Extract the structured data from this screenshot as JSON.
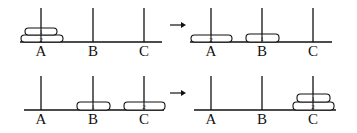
{
  "diagram": {
    "title": "",
    "peg_labels": [
      "A",
      "B",
      "C"
    ],
    "line_color": "#111111",
    "panels": [
      {
        "id": "step-1",
        "position": "top-left",
        "pegs": {
          "A": [
            "2",
            "1"
          ],
          "B": [],
          "C": []
        }
      },
      {
        "id": "step-2",
        "position": "top-right",
        "pegs": {
          "A": [
            "2"
          ],
          "B": [
            "1"
          ],
          "C": []
        }
      },
      {
        "id": "step-3",
        "position": "bottom-left",
        "pegs": {
          "A": [],
          "B": [
            "1"
          ],
          "C": [
            "2"
          ]
        }
      },
      {
        "id": "step-4",
        "position": "bottom-right",
        "pegs": {
          "A": [],
          "B": [],
          "C": [
            "2",
            "1"
          ]
        }
      }
    ],
    "arrows": [
      {
        "from": "step-1",
        "to": "step-2",
        "glyph": "→"
      },
      {
        "from": "step-3",
        "to": "step-4",
        "glyph": "→"
      }
    ]
  }
}
